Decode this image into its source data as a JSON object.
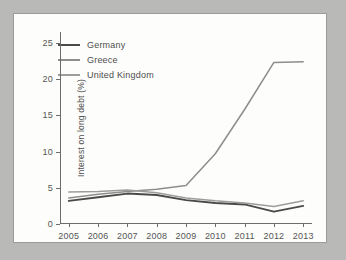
{
  "chart_data": {
    "type": "line",
    "title": "",
    "xlabel": "",
    "ylabel": "Interest on long debt (%)",
    "x": [
      2005,
      2006,
      2007,
      2008,
      2009,
      2010,
      2011,
      2012,
      2013
    ],
    "xtick_labels": [
      "2005",
      "2006",
      "2007",
      "2008",
      "2009",
      "2010",
      "2011",
      "2012",
      "2013"
    ],
    "ytick_labels": [
      "0",
      "5",
      "10",
      "15",
      "20",
      "25"
    ],
    "ytick_values": [
      0,
      5,
      10,
      15,
      20,
      25
    ],
    "ylim": [
      0,
      26.5
    ],
    "xlim": [
      2004.7,
      2013.3
    ],
    "grid": false,
    "legend_position": "upper-left-inside",
    "series": [
      {
        "name": "Germany",
        "color": "#4a4a4a",
        "values": [
          3.2,
          3.7,
          4.2,
          4.0,
          3.3,
          2.9,
          2.7,
          1.7,
          2.5
        ]
      },
      {
        "name": "Greece",
        "color": "#8d8d8d",
        "values": [
          3.6,
          4.1,
          4.5,
          4.8,
          5.3,
          9.7,
          15.8,
          22.3,
          22.4
        ]
      },
      {
        "name": "United Kingdom",
        "color": "#9d9d9d",
        "values": [
          4.4,
          4.5,
          4.7,
          4.3,
          3.6,
          3.2,
          2.9,
          2.4,
          3.2
        ]
      }
    ]
  },
  "colors": {
    "page_background": "#b9b9b7",
    "card_background": "#fdfdfb",
    "card_border": "#9a9a98",
    "axis": "#6c6c6c",
    "tick_text": "#555555",
    "label_text": "#4e4e4e"
  }
}
